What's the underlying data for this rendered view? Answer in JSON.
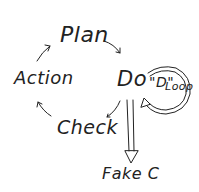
{
  "diagram": {
    "nodes": [
      {
        "id": "plan",
        "label": "Plan"
      },
      {
        "id": "do",
        "label": "Do"
      },
      {
        "id": "check",
        "label": "Check"
      },
      {
        "id": "action",
        "label": "Action"
      },
      {
        "id": "fake_c",
        "label": "Fake C"
      }
    ],
    "loop_label_d": "\"D\"",
    "loop_label_loop": "Loop",
    "edges": [
      {
        "from": "plan",
        "to": "do"
      },
      {
        "from": "do",
        "to": "check"
      },
      {
        "from": "check",
        "to": "action"
      },
      {
        "from": "action",
        "to": "plan"
      },
      {
        "from": "do",
        "to": "do",
        "label": "\"D\" Loop"
      },
      {
        "from": "do",
        "to": "fake_c",
        "style": "double-arrow"
      }
    ],
    "ink_color": "#222222",
    "background": "#ffffff"
  }
}
